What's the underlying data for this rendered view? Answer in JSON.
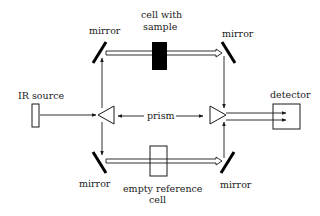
{
  "diagram": {
    "type": "double-beam IR spectrometer schematic",
    "colors": {
      "line": "#1a1a1a",
      "fill_dark": "#000000",
      "background": "#ffffff"
    },
    "labels": {
      "mirror_top_left": "mirror",
      "mirror_top_right": "mirror",
      "mirror_bottom_left": "mirror",
      "mirror_bottom_right": "mirror",
      "sample_cell_line1": "cell with",
      "sample_cell_line2": "sample",
      "ir_source": "IR source",
      "prism": "prism",
      "detector": "detector",
      "reference_cell_line1": "empty reference",
      "reference_cell_line2": "cell"
    },
    "components": [
      {
        "name": "IR source",
        "shape": "rectangle"
      },
      {
        "name": "prism (left)",
        "shape": "triangle-left"
      },
      {
        "name": "prism (right)",
        "shape": "triangle-right"
      },
      {
        "name": "mirror",
        "count": 4,
        "shape": "diagonal-bar"
      },
      {
        "name": "cell with sample",
        "shape": "filled-rectangle"
      },
      {
        "name": "empty reference cell",
        "shape": "outlined-rectangle"
      },
      {
        "name": "detector",
        "shape": "square"
      }
    ]
  }
}
